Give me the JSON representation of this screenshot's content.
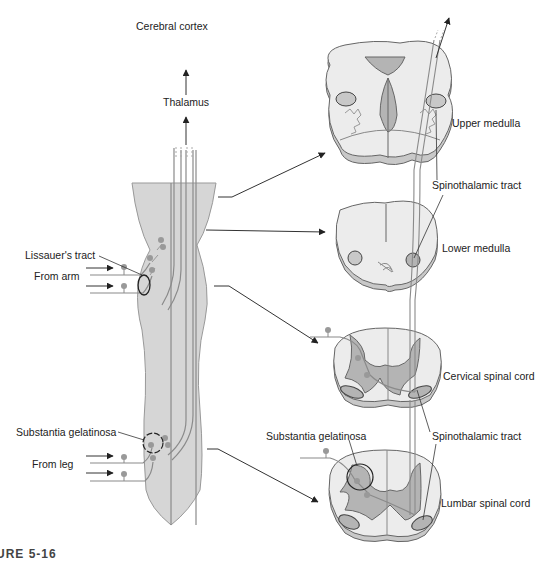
{
  "diagram": {
    "type": "anatomical-pathway",
    "labels": {
      "cerebral_cortex": "Cerebral cortex",
      "thalamus": "Thalamus",
      "lissauers_tract": "Lissauer's tract",
      "from_arm": "From arm",
      "substantia_gelatinosa_left": "Substantia gelatinosa",
      "from_leg": "From leg",
      "upper_medulla": "Upper medulla",
      "spinothalamic_tract_upper": "Spinothalamic tract",
      "lower_medulla": "Lower medulla",
      "cervical_spinal_cord": "Cervical spinal cord",
      "substantia_gelatinosa_right": "Substantia gelatinosa",
      "spinothalamic_tract_lower": "Spinothalamic tract",
      "lumbar_spinal_cord": "Lumbar spinal cord"
    },
    "sections": [
      "Upper medulla",
      "Lower medulla",
      "Cervical spinal cord",
      "Lumbar spinal cord"
    ],
    "colors": {
      "tissue_light": "#ececec",
      "tissue_shadow": "#c8c8c8",
      "gray_matter": "#b4b4b4",
      "nerve_line": "#8a8a8a",
      "outline": "#555555",
      "text": "#222222"
    }
  },
  "caption": {
    "figure": "URE 5-16",
    "text": "The spinothalamic tract..."
  }
}
